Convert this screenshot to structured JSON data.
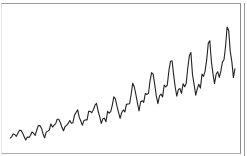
{
  "chart_data": {
    "type": "line",
    "title": "",
    "xlabel": "",
    "ylabel": "",
    "grid": false,
    "legend": null,
    "x_range": [
      1949,
      1961
    ],
    "ylim": [
      100,
      630
    ],
    "series": [
      {
        "name": "series",
        "color": "#222222",
        "values": [
          112,
          118,
          132,
          129,
          121,
          135,
          148,
          148,
          136,
          119,
          104,
          118,
          115,
          126,
          141,
          135,
          125,
          149,
          170,
          170,
          158,
          133,
          114,
          140,
          145,
          150,
          178,
          163,
          172,
          178,
          199,
          199,
          184,
          162,
          146,
          166,
          171,
          180,
          193,
          181,
          183,
          218,
          230,
          242,
          209,
          191,
          172,
          194,
          196,
          196,
          236,
          235,
          229,
          243,
          264,
          272,
          237,
          211,
          180,
          201,
          204,
          188,
          235,
          227,
          234,
          264,
          302,
          293,
          259,
          229,
          203,
          229,
          242,
          233,
          267,
          269,
          270,
          315,
          364,
          347,
          312,
          274,
          237,
          278,
          284,
          277,
          317,
          313,
          318,
          374,
          413,
          405,
          355,
          306,
          271,
          306,
          315,
          301,
          356,
          348,
          355,
          422,
          465,
          467,
          404,
          347,
          305,
          336,
          340,
          318,
          362,
          348,
          363,
          435,
          491,
          505,
          404,
          359,
          310,
          337,
          360,
          342,
          406,
          396,
          420,
          472,
          548,
          559,
          463,
          407,
          362,
          405,
          417,
          391,
          419,
          461,
          472,
          535,
          622,
          606,
          508,
          461,
          390,
          432
        ]
      }
    ]
  }
}
